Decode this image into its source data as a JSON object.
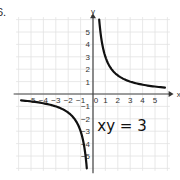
{
  "problem_label": "6.",
  "chart_data": {
    "type": "line",
    "title": "",
    "equation": "xy = 3",
    "function": "y = 3/x",
    "xlabel": "x",
    "ylabel": "y",
    "xlim": [
      -6,
      6
    ],
    "ylim": [
      -6,
      6
    ],
    "grid": true,
    "x_tick_labels": [
      "-5",
      "-4",
      "-3",
      "-2",
      "-1",
      "0",
      "1",
      "2",
      "3",
      "4",
      "5"
    ],
    "y_tick_labels": [
      "5",
      "4",
      "3",
      "2",
      "1",
      "-1",
      "-2",
      "-3",
      "-4",
      "-5"
    ],
    "series": [
      {
        "name": "branch-positive",
        "x": [
          0.5,
          0.6,
          0.75,
          1,
          1.5,
          2,
          3,
          4,
          5,
          5.8
        ],
        "y": [
          6,
          5,
          4,
          3,
          2,
          1.5,
          1,
          0.75,
          0.6,
          0.52
        ]
      },
      {
        "name": "branch-negative",
        "x": [
          -5.8,
          -5,
          -4,
          -3,
          -2,
          -1.5,
          -1,
          -0.75,
          -0.6,
          -0.5
        ],
        "y": [
          -0.52,
          -0.6,
          -0.75,
          -1,
          -1.5,
          -2,
          -3,
          -4,
          -5,
          -6
        ]
      }
    ],
    "annotations": [
      {
        "text": "xy = 3",
        "x": 3,
        "y": -2.5
      }
    ]
  }
}
